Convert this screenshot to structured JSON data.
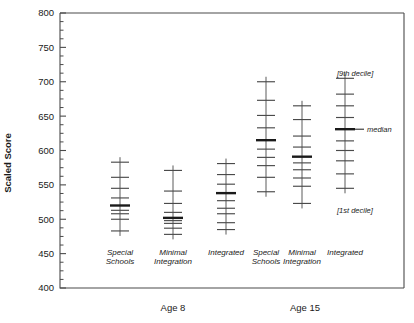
{
  "chart_data": {
    "type": "scatter",
    "title": "",
    "xlabel": "",
    "ylabel": "Scaled Score",
    "ylim": [
      400,
      800
    ],
    "ytick_labels": [
      "800",
      "750",
      "700",
      "650",
      "600",
      "550",
      "500",
      "450",
      "400"
    ],
    "ytick_values": [
      800,
      750,
      700,
      650,
      600,
      550,
      500,
      450,
      400
    ],
    "ytick_minor_step": 12.5,
    "grid": false,
    "legend": "none",
    "plot_description": "Decile plots of scaled score by educational placement for two age groups. Each vertical spine carries horizontal tick marks at decile positions; the thick tick marks the median.",
    "group_labels": [
      "Age 8",
      "Age 15"
    ],
    "categories": [
      "Special Schools",
      "Minimal Integration",
      "Integrated"
    ],
    "annotations": [
      {
        "text": "[9th decile]",
        "value": 712,
        "target": "Age 15 / Integrated"
      },
      {
        "text": "median",
        "value": 631,
        "target": "Age 15 / Integrated"
      },
      {
        "text": "[1st decile]",
        "value": 513,
        "target": "Age 15 / Integrated"
      }
    ],
    "groups": [
      {
        "name": "Age 8",
        "series": [
          {
            "name": "Special Schools",
            "median": 520,
            "deciles": [
              483,
              500,
              508,
              513,
              520,
              531,
              545,
              561,
              583
            ]
          },
          {
            "name": "Minimal Integration",
            "median": 502,
            "deciles": [
              478,
              487,
              494,
              498,
              502,
              510,
              523,
              541,
              571
            ]
          },
          {
            "name": "Integrated",
            "median": 538,
            "deciles": [
              485,
              495,
              508,
              516,
              527,
              538,
              551,
              565,
              581
            ]
          }
        ]
      },
      {
        "name": "Age 15",
        "series": [
          {
            "name": "Special Schools",
            "median": 615,
            "deciles": [
              540,
              561,
              578,
              590,
              602,
              615,
              633,
              651,
              673,
              700
            ]
          },
          {
            "name": "Minimal Integration",
            "median": 591,
            "deciles": [
              523,
              548,
              560,
              572,
              582,
              591,
              605,
              621,
              645,
              665
            ]
          },
          {
            "name": "Integrated",
            "median": 631,
            "deciles": [
              545,
              566,
              585,
              600,
              614,
              631,
              648,
              665,
              682,
              705
            ]
          }
        ]
      }
    ]
  },
  "axis": {
    "y_title": "Scaled Score"
  }
}
